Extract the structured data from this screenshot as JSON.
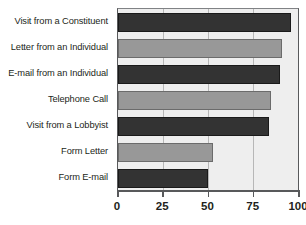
{
  "chart_data": {
    "type": "bar",
    "orientation": "horizontal",
    "title": "",
    "xlabel": "",
    "ylabel": "",
    "categories": [
      "Visit from a Constituent",
      "Letter from an Individual",
      "E-mail from an Individual",
      "Telephone Call",
      "Visit from a Lobbyist",
      "Form Letter",
      "Form E-mail"
    ],
    "values": [
      96,
      91,
      90,
      85,
      84,
      53,
      50
    ],
    "bar_colors": [
      "dark",
      "light",
      "dark",
      "light",
      "dark",
      "light",
      "dark"
    ],
    "xlim": [
      0,
      100
    ],
    "xticks": [
      0,
      25,
      50,
      75,
      100
    ],
    "xtick_labels": [
      "0",
      "25",
      "50",
      "75",
      "100"
    ],
    "grid": true,
    "grid_axis": "x",
    "legend": "none",
    "colors": {
      "dark_bar": "#333333",
      "light_bar": "#989898",
      "plot_background": "#eeeeee",
      "gridline": "#b7b7b7",
      "axis": "#58595b",
      "text": "#231f20"
    }
  }
}
